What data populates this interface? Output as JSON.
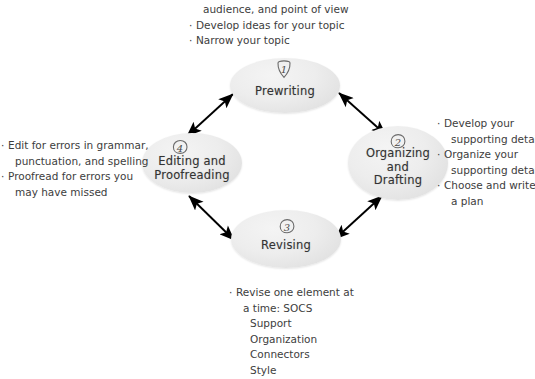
{
  "diagram": {
    "type": "cycle",
    "background_color": "#ffffff",
    "node_fill_color": "#e9e9e9",
    "text_color": "#3d3d3d",
    "arrow_color": "#000000"
  },
  "nodes": [
    {
      "id": "prewriting",
      "step": "1",
      "label": "Prewriting"
    },
    {
      "id": "organizing",
      "step": "2",
      "label": "Organizing\nand\nDrafting"
    },
    {
      "id": "revising",
      "step": "3",
      "label": "Revising"
    },
    {
      "id": "editing",
      "step": "4",
      "label": "Editing and\nProofreading"
    }
  ],
  "annotations": {
    "top": {
      "lines": [
        {
          "text": "audience, and point of view",
          "style": "cont"
        },
        {
          "text": "Develop ideas for your topic",
          "style": "bullet"
        },
        {
          "text": "Narrow your topic",
          "style": "bullet"
        }
      ]
    },
    "right": {
      "lines": [
        {
          "text": "Develop your",
          "style": "bullet"
        },
        {
          "text": "supporting details",
          "style": "cont"
        },
        {
          "text": "Organize your",
          "style": "bullet"
        },
        {
          "text": "supporting details",
          "style": "cont"
        },
        {
          "text": "Choose and write",
          "style": "bullet"
        },
        {
          "text": "a plan",
          "style": "cont"
        }
      ]
    },
    "left": {
      "lines": [
        {
          "text": "Edit for errors in grammar,",
          "style": "bullet"
        },
        {
          "text": "punctuation, and spelling",
          "style": "cont"
        },
        {
          "text": "Proofread for errors you",
          "style": "bullet"
        },
        {
          "text": "may have missed",
          "style": "cont"
        }
      ]
    },
    "bottom": {
      "lines": [
        {
          "text": "Revise one element at",
          "style": "bullet"
        },
        {
          "text": "a time: SOCS",
          "style": "cont"
        },
        {
          "text": "Support",
          "style": "sub"
        },
        {
          "text": "Organization",
          "style": "sub"
        },
        {
          "text": "Connectors",
          "style": "sub"
        },
        {
          "text": "Style",
          "style": "sub"
        }
      ]
    }
  },
  "arrows": [
    {
      "id": "editing-prewriting",
      "heads": "double"
    },
    {
      "id": "prewriting-organizing",
      "heads": "double"
    },
    {
      "id": "organizing-revising",
      "heads": "double"
    },
    {
      "id": "revising-editing",
      "heads": "double"
    }
  ]
}
